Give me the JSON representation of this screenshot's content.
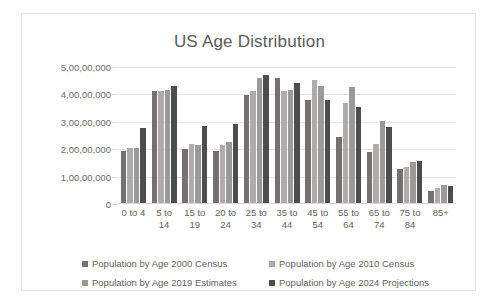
{
  "chart_data": {
    "type": "bar",
    "title": "US Age Distribution",
    "xlabel": "",
    "ylabel": "",
    "ylim": [
      0,
      50000000
    ],
    "ytick_values": [
      0,
      10000000,
      20000000,
      30000000,
      40000000,
      50000000
    ],
    "ytick_labels": [
      "0",
      "1,00,00,000",
      "2,00,00,000",
      "3,00,00,000",
      "4,00,00,000",
      "5,00,00,000"
    ],
    "grid": true,
    "legend_position": "bottom",
    "number_format": "indian",
    "categories": [
      "0 to 4",
      "5 to\n14",
      "15 to\n19",
      "20 to\n24",
      "25 to\n34",
      "35 to\n44",
      "45 to\n54",
      "55 to\n64",
      "65 to\n74",
      "75 to\n84",
      "85+"
    ],
    "series": [
      {
        "name": "Population by Age 2000 Census",
        "color": "#767171",
        "values": [
          18900000,
          41000000,
          19700000,
          18900000,
          39500000,
          45800000,
          37500000,
          24000000,
          18500000,
          12500000,
          4400000
        ]
      },
      {
        "name": "Population by Age 2010 Census",
        "color": "#afabab",
        "values": [
          20000000,
          40700000,
          21600000,
          21100000,
          41000000,
          40800000,
          44800000,
          36500000,
          21500000,
          13100000,
          5500000
        ]
      },
      {
        "name": "Population by Age 2019 Estimates",
        "color": "#9c9999",
        "values": [
          20000000,
          41300000,
          21100000,
          22100000,
          45500000,
          41200000,
          42800000,
          42400000,
          29900000,
          14900000,
          6500000
        ]
      },
      {
        "name": "Population by Age 2024 Projections",
        "color": "#4d4d4d",
        "values": [
          27200000,
          42600000,
          28200000,
          29000000,
          46800000,
          43900000,
          37700000,
          35200000,
          27600000,
          15300000,
          6100000
        ]
      }
    ]
  }
}
